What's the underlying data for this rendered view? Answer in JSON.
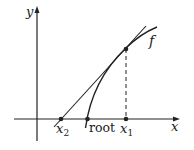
{
  "figure": {
    "colors": {
      "ink": "#222222",
      "background": "#ffffff"
    },
    "axes": {
      "x_label": "x",
      "y_label": "y"
    },
    "curve": {
      "label": "f"
    },
    "points": {
      "x2": {
        "label_base": "x",
        "label_sub": "2"
      },
      "root": {
        "label": "root"
      },
      "x1": {
        "label_base": "x",
        "label_sub": "1"
      }
    }
  }
}
